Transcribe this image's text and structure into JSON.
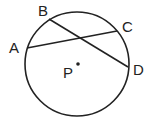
{
  "diagram": {
    "type": "circle-with-intersecting-chords",
    "circle": {
      "center_label": "P",
      "cx": 77,
      "cy": 64,
      "r": 52
    },
    "points": [
      {
        "label": "A",
        "x": 27,
        "y": 48,
        "lx": 15,
        "ly": 52
      },
      {
        "label": "B",
        "x": 49,
        "y": 19,
        "lx": 43,
        "ly": 15
      },
      {
        "label": "C",
        "x": 117,
        "y": 31,
        "lx": 127,
        "ly": 32
      },
      {
        "label": "D",
        "x": 128,
        "y": 67,
        "lx": 139,
        "ly": 75
      }
    ],
    "chords": [
      {
        "from": "A",
        "to": "C"
      },
      {
        "from": "B",
        "to": "D"
      }
    ],
    "center": {
      "label": "P",
      "x": 78,
      "y": 64,
      "lx": 69,
      "ly": 78
    },
    "colors": {
      "stroke": "#222222",
      "background": "#ffffff"
    }
  }
}
